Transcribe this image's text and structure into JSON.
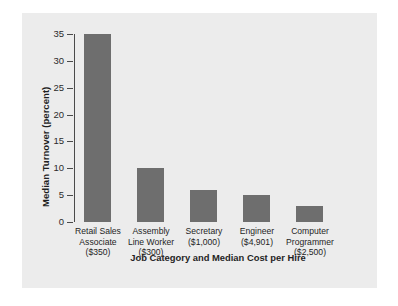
{
  "chart_data": {
    "type": "bar",
    "title": "",
    "xlabel": "Job Category and Median Cost per Hire",
    "ylabel": "Median Turnover (percent)",
    "categories": [
      "Retail Sales\nAssociate\n($350)",
      "Assembly\nLine Worker\n($300)",
      "Secretary\n($1,000)",
      "Engineer\n($4,901)",
      "Computer\nProgrammer\n($2,500)"
    ],
    "category_lines": [
      [
        "Retail Sales",
        "Associate",
        "($350)"
      ],
      [
        "Assembly",
        "Line Worker",
        "($300)"
      ],
      [
        "Secretary",
        "($1,000)",
        ""
      ],
      [
        "Engineer",
        "($4,901)",
        ""
      ],
      [
        "Computer",
        "Programmer",
        "($2,500)"
      ]
    ],
    "values": [
      35,
      10,
      6,
      5,
      3
    ],
    "ylim": [
      0,
      35
    ],
    "yticks": [
      0,
      5,
      10,
      15,
      20,
      25,
      30,
      35
    ],
    "ytick_labels": [
      "0",
      "5",
      "10",
      "15",
      "20",
      "25",
      "30",
      "35"
    ],
    "grid": false,
    "legend": "none",
    "bar_color": "#6e6e6e",
    "panel_color": "#ececec",
    "axis_color": "#4a4a4a"
  }
}
